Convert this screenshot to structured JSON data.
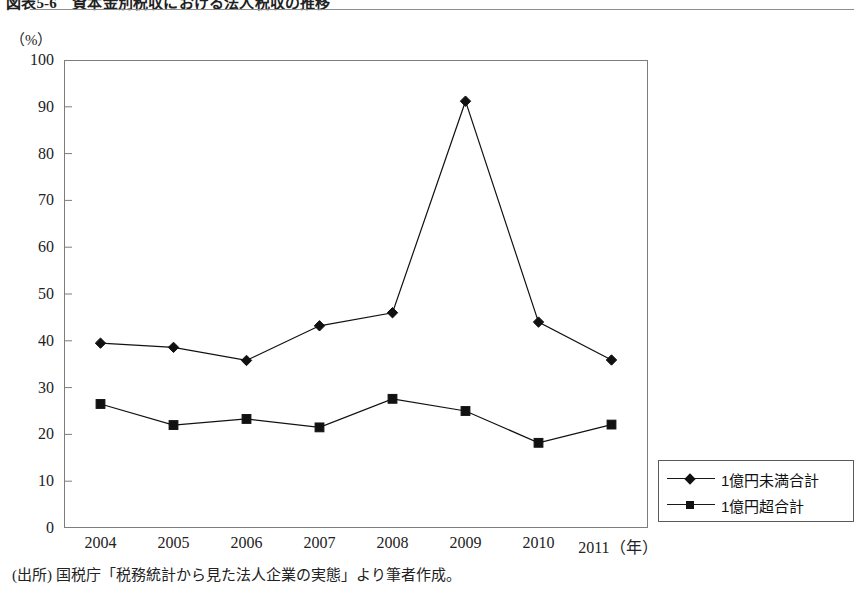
{
  "figure": {
    "title": "図表5-6　資本金別税収における法人税収の推移",
    "unit_label": "（%）",
    "source_note": "(出所) 国税庁「税務統計から見た法人企業の実態」より筆者作成。"
  },
  "chart_data": {
    "type": "line",
    "title": "図表5-6　資本金別税収における法人税収の推移",
    "xlabel": "（年）",
    "ylabel": "（%）",
    "categories": [
      "2004",
      "2005",
      "2006",
      "2007",
      "2008",
      "2009",
      "2010",
      "2011"
    ],
    "x_axis_suffix": "（年）",
    "ylim": [
      0,
      100
    ],
    "yticks": [
      0,
      10,
      20,
      30,
      40,
      50,
      60,
      70,
      80,
      90,
      100
    ],
    "ytick_labels": [
      "0",
      "10",
      "20",
      "30",
      "40",
      "50",
      "60",
      "70",
      "80",
      "90",
      "100"
    ],
    "grid": false,
    "legend_position": "bottom-right-outside",
    "series": [
      {
        "name": "1億円未満合計",
        "marker": "diamond",
        "color": "#111111",
        "values": [
          39.5,
          38.6,
          35.8,
          43.2,
          46.0,
          91.2,
          44.0,
          35.9
        ]
      },
      {
        "name": "1億円超合計",
        "marker": "square",
        "color": "#111111",
        "values": [
          26.5,
          22.0,
          23.3,
          21.5,
          27.6,
          25.0,
          18.2,
          22.1
        ]
      }
    ]
  },
  "legend": {
    "items": [
      {
        "label": "1億円未満合計",
        "marker": "diamond"
      },
      {
        "label": "1億円超合計",
        "marker": "square"
      }
    ]
  }
}
